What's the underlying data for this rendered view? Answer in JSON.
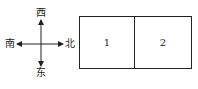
{
  "compass": {
    "top": "西",
    "bottom": "东",
    "left": "南",
    "right": "北"
  },
  "boxes": [
    {
      "label": "1"
    },
    {
      "label": "2"
    }
  ],
  "colors": {
    "stroke": "#222222",
    "background": "#ffffff"
  }
}
